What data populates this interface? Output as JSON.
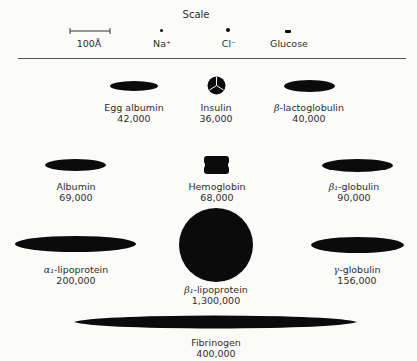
{
  "scale": {
    "title": "Scale",
    "bar_label": "100Å",
    "items": [
      {
        "name": "Na+",
        "label": "Na⁺"
      },
      {
        "name": "Cl-",
        "label": "Cl⁻"
      },
      {
        "name": "Glucose",
        "label": "Glucose"
      }
    ]
  },
  "proteins": [
    {
      "name": "Egg albumin",
      "mw": "42,000",
      "shape": "ellipse"
    },
    {
      "name": "Insulin",
      "mw": "36,000",
      "shape": "sphere-trimer"
    },
    {
      "prefix": "β",
      "name": "-lactoglobulin",
      "mw": "40,000",
      "shape": "ellipse"
    },
    {
      "name": "Albumin",
      "mw": "69,000",
      "shape": "ellipse"
    },
    {
      "name": "Hemoglobin",
      "mw": "68,000",
      "shape": "lobed-block"
    },
    {
      "prefix": "β₁",
      "name": "-globulin",
      "mw": "90,000",
      "shape": "ellipse"
    },
    {
      "prefix": "α₁",
      "name": "-lipoprotein",
      "mw": "200,000",
      "shape": "ellipse"
    },
    {
      "prefix": "β₁",
      "name": "-lipoprotein",
      "mw": "1,300,000",
      "shape": "sphere"
    },
    {
      "prefix": "γ",
      "name": "-globulin",
      "mw": "156,000",
      "shape": "ellipse"
    },
    {
      "name": "Fibrinogen",
      "mw": "400,000",
      "shape": "spindle"
    }
  ],
  "colors": {
    "shape_fill": "#0b0b0b",
    "background": "#fbfbf9",
    "text": "#2e2e2e"
  }
}
